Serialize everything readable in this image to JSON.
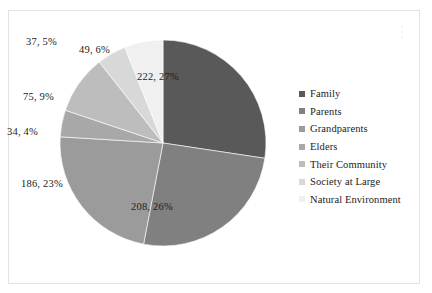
{
  "chart_data": {
    "type": "pie",
    "title": "",
    "subtitle": "",
    "xlabel": "",
    "ylabel": "",
    "grid": false,
    "legend_position": "right",
    "total": 811,
    "start_angle_deg": 0,
    "direction": "clockwise",
    "categories": [
      "Family",
      "Parents",
      "Grandparents",
      "Elders",
      "Their Community",
      "Society at Large",
      "Natural Environment"
    ],
    "values": [
      222,
      208,
      186,
      34,
      75,
      37,
      49
    ],
    "percents": [
      27,
      26,
      23,
      4,
      9,
      5,
      6
    ],
    "data_labels": [
      "222, 27%",
      "208, 26%",
      "186, 23%",
      "34, 4%",
      "75, 9%",
      "37, 5%",
      "49, 6%"
    ],
    "colors": [
      "#595959",
      "#808080",
      "#9b9b9b",
      "#a8a8a8",
      "#bdbdbd",
      "#d8d8d8",
      "#f0f0f0"
    ]
  },
  "legend": {
    "items": [
      {
        "label": "Family",
        "color": "#595959"
      },
      {
        "label": "Parents",
        "color": "#808080"
      },
      {
        "label": "Grandparents",
        "color": "#9b9b9b"
      },
      {
        "label": "Elders",
        "color": "#a8a8a8"
      },
      {
        "label": "Their Community",
        "color": "#bdbdbd"
      },
      {
        "label": "Society at Large",
        "color": "#d8d8d8"
      },
      {
        "label": "Natural Environment",
        "color": "#f0f0f0"
      }
    ]
  },
  "labels": {
    "family": "222, 27%",
    "parents": "208, 26%",
    "grandparents": "186, 23%",
    "elders": "34, 4%",
    "their_community": "75, 9%",
    "society_at_large": "37, 5%",
    "natural_environment": "49, 6%"
  }
}
